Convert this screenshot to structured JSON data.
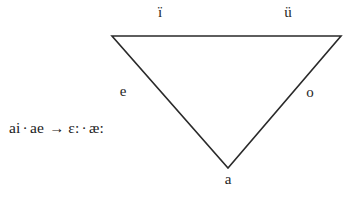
{
  "figure": {
    "type": "vowel-triangle-diagram",
    "background_color": "#ffffff",
    "stroke_color": "#2a2a2a",
    "text_color": "#212121",
    "vertex_labels": {
      "top_left": "ï",
      "top_right": "ü",
      "mid_left": "e",
      "mid_right": "o",
      "bottom": "a"
    },
    "sound_change": {
      "source_first": "ai",
      "separator_dot": "·",
      "source_second": "ae",
      "arrow": "→",
      "target_first": "ɛ:",
      "target_second": "æ:"
    }
  }
}
